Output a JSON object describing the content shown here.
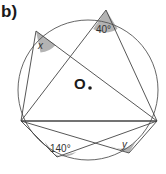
{
  "part_label": "b)",
  "center_label": "O",
  "angles": {
    "top": "40°",
    "upper_left": "x",
    "bottom_left": "140°",
    "bottom_right": "y"
  },
  "colors": {
    "line": "#444444",
    "circle": "#555555",
    "angle_fill": "#b3b3b3",
    "text": "#1a1a1a"
  },
  "geometry": {
    "circle": {
      "cx": 88,
      "cy": 90,
      "r": 70
    },
    "points": {
      "A_top": [
        106,
        10
      ],
      "B_upper_left": [
        36,
        31
      ],
      "L_left": [
        21,
        121
      ],
      "R_right": [
        157,
        121
      ],
      "P_bottom_left": [
        57,
        157
      ],
      "Q_bottom_right": [
        129,
        153
      ]
    }
  }
}
